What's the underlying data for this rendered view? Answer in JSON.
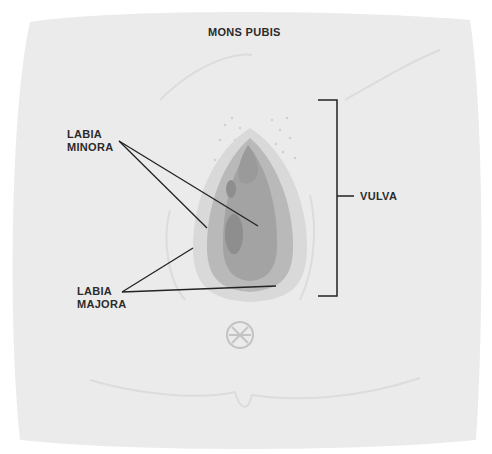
{
  "diagram": {
    "labels": {
      "mons_pubis": "MONS PUBIS",
      "labia_minora_line1": "LABIA",
      "labia_minora_line2": "MINORA",
      "labia_majora_line1": "LABIA",
      "labia_majora_line2": "MAJORA",
      "vulva": "VULVA"
    },
    "colors": {
      "background_skin": "#ebebeb",
      "outer_tissue": "#d9d9d9",
      "labia_minora": "#b9b9b9",
      "inner_tissue": "#a3a3a3",
      "opening": "#8e8e8e",
      "line": "#222222",
      "label_text": "#2b2b2b"
    }
  }
}
